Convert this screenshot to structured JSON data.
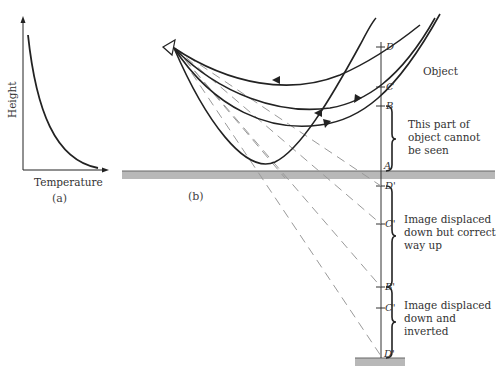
{
  "figure": {
    "panel_a": {
      "caption": "(a)",
      "x_axis_label": "Temperature",
      "y_axis_label": "Height",
      "curve": "height decreases with temperature (decaying curve)"
    },
    "panel_b": {
      "caption": "(b)",
      "object_label": "Object",
      "points_object": [
        "D",
        "C",
        "B",
        "A"
      ],
      "points_image": [
        "D'",
        "C'",
        "B'",
        "C'",
        "D'"
      ],
      "annotations": [
        {
          "id": "hidden",
          "text_lines": [
            "This part of",
            "object cannot",
            "be seen"
          ]
        },
        {
          "id": "upright",
          "text_lines": [
            "Image displaced",
            "down but correct",
            "way up"
          ]
        },
        {
          "id": "inverted",
          "text_lines": [
            "Image displaced",
            "down and",
            "inverted"
          ]
        }
      ]
    }
  },
  "colors": {
    "ray": "#222222",
    "dashed": "#9a9a9a",
    "ground": "#b8b8b8",
    "ground_edge": "#666666"
  }
}
